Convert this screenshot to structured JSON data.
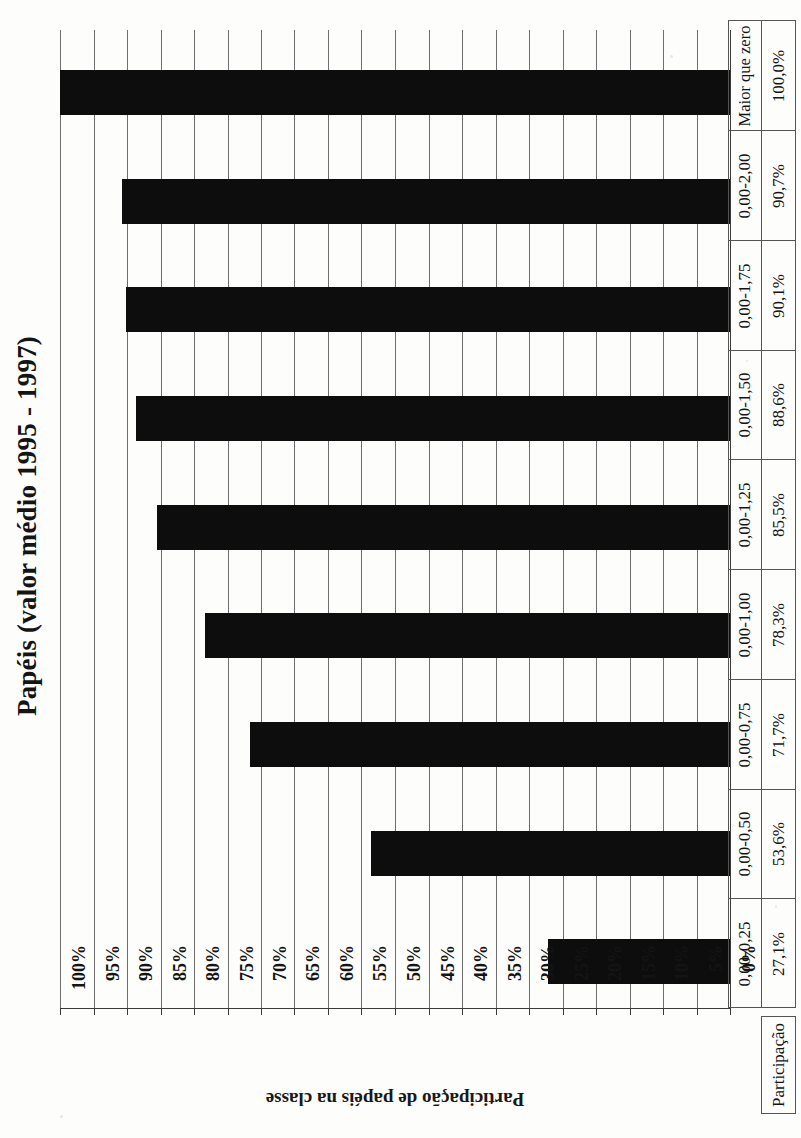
{
  "chart_data": {
    "type": "bar",
    "orientation": "horizontal",
    "title": "Papéis (valor médio 1995 - 1997)",
    "xlabel": "Participação de papéis na classe",
    "ylabel": "",
    "categories": [
      "Maior que zero",
      "0,00-2,00",
      "0,00-1,75",
      "0,00-1,50",
      "0,00-1,25",
      "0,00-1,00",
      "0,00-0,75",
      "0,00-0,50",
      "0,00-0,25"
    ],
    "values": [
      100.0,
      90.7,
      90.1,
      88.6,
      85.5,
      78.3,
      71.7,
      53.6,
      27.1
    ],
    "value_labels": [
      "100,0%",
      "90,7%",
      "90,1%",
      "88,6%",
      "85,5%",
      "78,3%",
      "71,7%",
      "53,6%",
      "27,1%"
    ],
    "ylim": [
      0,
      100
    ],
    "tick_labels": [
      "100%",
      "95%",
      "90%",
      "85%",
      "80%",
      "75%",
      "70%",
      "65%",
      "60%",
      "55%",
      "50%",
      "45%",
      "40%",
      "35%",
      "30%",
      "25%",
      "20%",
      "15%",
      "10%",
      "5%",
      "0%"
    ],
    "tick_values": [
      100,
      95,
      90,
      85,
      80,
      75,
      70,
      65,
      60,
      55,
      50,
      45,
      40,
      35,
      30,
      25,
      20,
      15,
      10,
      5,
      0
    ],
    "grid": true,
    "legend": "none",
    "bar_color": "#0d0d0d"
  },
  "table": {
    "footer_label": "Participação",
    "category_header": "Maior que zero"
  },
  "colors": {
    "bar": "#0d0d0d",
    "grid": "#6e6e6e",
    "axis": "#3a3a3a",
    "text": "#141414",
    "background": "#fdfdfc"
  }
}
